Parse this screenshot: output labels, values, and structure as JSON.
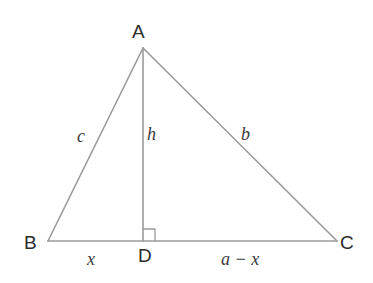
{
  "diagram": {
    "type": "geometry-triangle-altitude",
    "background_color": "#ffffff",
    "stroke_color": "#9a9a9a",
    "stroke_width": 1.6,
    "vertex_label_color": "#2b2b2b",
    "side_label_color": "#3a3a3a",
    "points": {
      "A": {
        "x": 143,
        "y": 48
      },
      "B": {
        "x": 48,
        "y": 241
      },
      "C": {
        "x": 337,
        "y": 241
      },
      "D": {
        "x": 143,
        "y": 241
      }
    },
    "segments": [
      {
        "name": "side-AB",
        "from": "B",
        "to": "A",
        "label": "c"
      },
      {
        "name": "side-AC",
        "from": "A",
        "to": "C",
        "label": "b"
      },
      {
        "name": "base-BC",
        "from": "B",
        "to": "C",
        "label": "a"
      },
      {
        "name": "altitude-AD",
        "from": "A",
        "to": "D",
        "label": "h"
      }
    ],
    "right_angle": {
      "at": "D",
      "size": 12,
      "side": "right"
    },
    "vertex_labels": {
      "A": "A",
      "B": "B",
      "C": "C",
      "D": "D"
    },
    "side_labels": {
      "c": "c",
      "h": "h",
      "b": "b",
      "x": "x",
      "a_minus_x": "a − x"
    }
  }
}
